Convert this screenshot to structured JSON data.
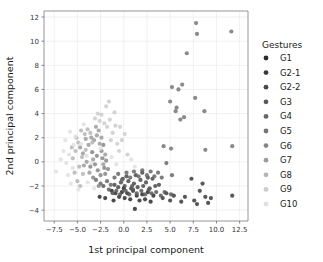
{
  "chart_data": {
    "type": "scatter",
    "title": "",
    "xlabel": "1st principal component",
    "ylabel": "2nd principal component",
    "xlim": [
      -8.6,
      13.4
    ],
    "ylim": [
      -4.9,
      12.5
    ],
    "xticks": [
      -7.5,
      -5.0,
      -2.5,
      0.0,
      2.5,
      5.0,
      7.5,
      10.0,
      12.5
    ],
    "xticklabels": [
      "−7.5",
      "−5.0",
      "−2.5",
      "0.0",
      "2.5",
      "5.0",
      "7.5",
      "10.0",
      "12.5"
    ],
    "yticks": [
      -4,
      -2,
      0,
      2,
      4,
      6,
      8,
      10,
      12
    ],
    "yticklabels": [
      "−4",
      "−2",
      "0",
      "2",
      "4",
      "6",
      "8",
      "10",
      "12"
    ],
    "grid": true,
    "legend": {
      "title": "Gestures",
      "position": "right",
      "entries": [
        {
          "label": "G1",
          "color": "#2b2b2b"
        },
        {
          "label": "G2-1",
          "color": "#3a3a3a"
        },
        {
          "label": "G2-2",
          "color": "#4a4a4a"
        },
        {
          "label": "G3",
          "color": "#585858"
        },
        {
          "label": "G4",
          "color": "#676767"
        },
        {
          "label": "G5",
          "color": "#757575"
        },
        {
          "label": "G6",
          "color": "#868686"
        },
        {
          "label": "G7",
          "color": "#9c9c9c"
        },
        {
          "label": "G8",
          "color": "#b5b5b5"
        },
        {
          "label": "G9",
          "color": "#cccccc"
        },
        {
          "label": "G10",
          "color": "#e0e0e0"
        }
      ]
    },
    "series": [
      {
        "name": "G1",
        "color": "#2b2b2b",
        "points": [
          [
            -2.6,
            -2.9
          ],
          [
            -2.0,
            -3.0
          ],
          [
            -1.3,
            -2.4
          ],
          [
            -0.9,
            -2.6
          ],
          [
            -0.5,
            -2.9
          ],
          [
            -0.2,
            -2.5
          ],
          [
            0.1,
            -3.0
          ],
          [
            0.4,
            -2.6
          ],
          [
            0.7,
            -3.1
          ],
          [
            1.0,
            -2.4
          ],
          [
            1.2,
            -3.9
          ],
          [
            1.4,
            -2.8
          ],
          [
            1.7,
            -3.2
          ],
          [
            2.0,
            -2.7
          ],
          [
            2.3,
            -3.1
          ],
          [
            2.6,
            -2.5
          ],
          [
            2.9,
            -3.3
          ],
          [
            3.2,
            -2.8
          ],
          [
            -1.1,
            -3.2
          ],
          [
            0.0,
            -2.2
          ]
        ]
      },
      {
        "name": "G2-1",
        "color": "#3a3a3a",
        "points": [
          [
            4.2,
            -3.0
          ],
          [
            4.6,
            -2.6
          ],
          [
            5.0,
            -3.2
          ],
          [
            5.4,
            -2.8
          ],
          [
            7.3,
            -1.4
          ],
          [
            7.6,
            -3.2
          ],
          [
            7.9,
            -3.5
          ],
          [
            8.2,
            -2.4
          ],
          [
            8.5,
            -1.8
          ],
          [
            8.8,
            -2.9
          ],
          [
            9.1,
            -3.4
          ],
          [
            9.4,
            -3.0
          ],
          [
            6.2,
            -3.3
          ],
          [
            6.6,
            -2.9
          ],
          [
            11.7,
            -2.8
          ]
        ]
      },
      {
        "name": "G2-2",
        "color": "#4a4a4a",
        "points": [
          [
            -1.0,
            -1.9
          ],
          [
            -0.6,
            -2.1
          ],
          [
            -0.3,
            -1.7
          ],
          [
            0.1,
            -2.0
          ],
          [
            0.5,
            -1.6
          ],
          [
            0.8,
            -2.2
          ],
          [
            1.1,
            -1.8
          ],
          [
            1.5,
            -2.1
          ],
          [
            1.8,
            -1.5
          ],
          [
            2.1,
            -2.0
          ],
          [
            2.4,
            -1.7
          ],
          [
            2.8,
            -2.2
          ],
          [
            3.1,
            -1.4
          ],
          [
            3.4,
            -2.0
          ],
          [
            3.8,
            -1.9
          ],
          [
            0.3,
            -1.2
          ],
          [
            1.3,
            -1.1
          ],
          [
            2.0,
            -0.9
          ],
          [
            2.6,
            -1.3
          ],
          [
            -0.1,
            -1.4
          ]
        ]
      },
      {
        "name": "G3",
        "color": "#585858",
        "points": [
          [
            -1.6,
            -2.3
          ],
          [
            -1.2,
            -2.6
          ],
          [
            -0.8,
            -2.4
          ],
          [
            -0.4,
            -2.7
          ],
          [
            0.2,
            -2.4
          ],
          [
            0.6,
            -2.7
          ],
          [
            1.0,
            -2.3
          ],
          [
            1.4,
            -2.6
          ],
          [
            1.9,
            -2.4
          ],
          [
            2.3,
            -2.7
          ],
          [
            2.7,
            -2.3
          ],
          [
            3.0,
            -2.6
          ],
          [
            3.5,
            -2.5
          ],
          [
            4.0,
            -2.8
          ],
          [
            4.4,
            -2.5
          ],
          [
            5.1,
            -2.7
          ],
          [
            0.9,
            -2.0
          ],
          [
            -2.2,
            -2.0
          ]
        ]
      },
      {
        "name": "G4",
        "color": "#676767",
        "points": [
          [
            -1.8,
            -1.6
          ],
          [
            -1.4,
            -1.9
          ],
          [
            -1.0,
            -1.3
          ],
          [
            -0.6,
            -1.0
          ],
          [
            -0.2,
            -1.5
          ],
          [
            0.3,
            -0.9
          ],
          [
            0.7,
            -1.3
          ],
          [
            1.1,
            -0.8
          ],
          [
            1.6,
            -1.2
          ],
          [
            2.0,
            -0.7
          ],
          [
            2.5,
            -1.1
          ],
          [
            2.9,
            -0.8
          ],
          [
            3.3,
            -1.2
          ],
          [
            3.7,
            -0.9
          ],
          [
            4.1,
            -1.3
          ],
          [
            4.6,
            -0.1
          ],
          [
            5.2,
            -1.1
          ],
          [
            -2.5,
            -1.8
          ],
          [
            -3.0,
            -1.5
          ]
        ]
      },
      {
        "name": "G5",
        "color": "#757575",
        "points": [
          [
            4.3,
            1.3
          ],
          [
            5.1,
            1.1
          ],
          [
            5.0,
            5.0
          ],
          [
            5.2,
            6.2
          ],
          [
            5.6,
            4.2
          ],
          [
            5.7,
            4.5
          ],
          [
            5.9,
            6.0
          ],
          [
            6.1,
            3.5
          ],
          [
            6.3,
            6.4
          ],
          [
            6.5,
            3.7
          ],
          [
            6.8,
            9.0
          ],
          [
            7.7,
            5.3
          ],
          [
            7.8,
            11.5
          ],
          [
            7.9,
            10.6
          ],
          [
            8.7,
            4.2
          ],
          [
            8.8,
            1.0
          ],
          [
            11.6,
            10.8
          ],
          [
            11.7,
            1.3
          ]
        ]
      },
      {
        "name": "G6",
        "color": "#868686",
        "points": [
          [
            -3.1,
            -0.2
          ],
          [
            -2.8,
            -0.7
          ],
          [
            -2.5,
            -1.1
          ],
          [
            -2.3,
            0.3
          ],
          [
            -2.1,
            -0.5
          ],
          [
            -2.7,
            -2.0
          ],
          [
            -3.3,
            -1.3
          ],
          [
            -2.0,
            -1.0
          ],
          [
            -1.7,
            -0.6
          ],
          [
            -3.6,
            -0.4
          ],
          [
            -2.4,
            0.9
          ],
          [
            -2.9,
            0.5
          ],
          [
            -1.9,
            0.1
          ],
          [
            -3.4,
            0.8
          ],
          [
            -2.2,
            1.4
          ]
        ]
      },
      {
        "name": "G7",
        "color": "#9c9c9c",
        "points": [
          [
            -3.2,
            1.8
          ],
          [
            -2.9,
            2.2
          ],
          [
            -2.6,
            1.5
          ],
          [
            -3.5,
            2.0
          ],
          [
            -3.8,
            1.4
          ],
          [
            -4.1,
            1.9
          ],
          [
            -2.7,
            2.6
          ],
          [
            -3.0,
            2.9
          ],
          [
            -4.4,
            0.7
          ],
          [
            -4.7,
            1.2
          ],
          [
            -2.4,
            2.0
          ],
          [
            -3.3,
            0.2
          ],
          [
            -4.0,
            0.0
          ],
          [
            -3.7,
            -0.9
          ],
          [
            -4.3,
            -0.3
          ],
          [
            -2.2,
            -0.2
          ],
          [
            -2.0,
            0.6
          ]
        ]
      },
      {
        "name": "G8",
        "color": "#b5b5b5",
        "points": [
          [
            -4.6,
            2.6
          ],
          [
            -4.2,
            2.3
          ],
          [
            -3.9,
            2.7
          ],
          [
            -4.9,
            1.6
          ],
          [
            -5.2,
            0.9
          ],
          [
            -5.5,
            0.3
          ],
          [
            -4.8,
            -0.4
          ],
          [
            -4.4,
            -1.0
          ],
          [
            -5.0,
            -1.6
          ],
          [
            -4.5,
            0.4
          ],
          [
            -4.1,
            1.0
          ],
          [
            -3.6,
            2.4
          ],
          [
            -5.3,
            -0.9
          ],
          [
            -5.6,
            1.2
          ],
          [
            -4.7,
            -2.0
          ],
          [
            -3.4,
            1.6
          ],
          [
            -5.1,
            2.0
          ]
        ]
      },
      {
        "name": "G9",
        "color": "#cccccc",
        "points": [
          [
            -2.1,
            3.2
          ],
          [
            -1.8,
            2.9
          ],
          [
            -1.5,
            3.5
          ],
          [
            -2.4,
            3.9
          ],
          [
            -1.2,
            2.4
          ],
          [
            -2.8,
            4.0
          ],
          [
            -1.0,
            4.1
          ],
          [
            -0.4,
            2.9
          ],
          [
            -0.7,
            1.5
          ],
          [
            -1.4,
            1.8
          ],
          [
            -0.2,
            1.8
          ],
          [
            -1.9,
            4.6
          ],
          [
            -2.6,
            3.4
          ],
          [
            -3.1,
            3.6
          ],
          [
            -0.9,
            3.0
          ],
          [
            0.1,
            2.3
          ],
          [
            -1.6,
            5.0
          ],
          [
            -0.5,
            0.9
          ],
          [
            0.4,
            0.6
          ]
        ]
      },
      {
        "name": "G10",
        "color": "#e0e0e0",
        "points": [
          [
            -7.3,
            -0.8
          ],
          [
            -6.2,
            -0.1
          ],
          [
            -5.9,
            0.6
          ],
          [
            -5.4,
            1.4
          ],
          [
            -6.0,
            -1.1
          ],
          [
            -5.7,
            -1.8
          ],
          [
            -6.5,
            0.9
          ],
          [
            -5.2,
            2.1
          ],
          [
            -4.9,
            -2.3
          ],
          [
            -5.8,
            2.5
          ],
          [
            -6.8,
            0.2
          ],
          [
            -4.3,
            3.1
          ],
          [
            -3.9,
            -1.7
          ],
          [
            -3.2,
            -2.2
          ],
          [
            -2.5,
            1.1
          ],
          [
            -1.3,
            0.4
          ],
          [
            -0.8,
            -0.2
          ],
          [
            0.8,
            0.2
          ],
          [
            1.2,
            -0.4
          ],
          [
            -4.0,
            0.5
          ],
          [
            -3.5,
            -0.1
          ],
          [
            -6.3,
            1.8
          ],
          [
            -5.5,
            -0.5
          ],
          [
            -4.6,
            1.5
          ]
        ]
      }
    ]
  }
}
